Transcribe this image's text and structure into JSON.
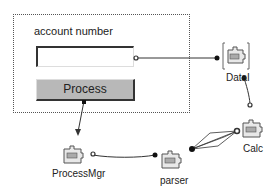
{
  "form": {
    "field_label": "account number",
    "field_value": "",
    "button_label": "Process"
  },
  "components": [
    {
      "name": "DataI",
      "label": "DataI"
    },
    {
      "name": "Calc",
      "label": "Calc"
    },
    {
      "name": "parser",
      "label": "parser"
    },
    {
      "name": "ProcessMgr",
      "label": "ProcessMgr"
    }
  ],
  "colors": {
    "wire": "#333333",
    "button_bg": "#b8b8b8",
    "panel_border": "#555555"
  }
}
